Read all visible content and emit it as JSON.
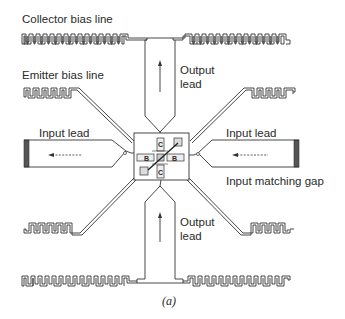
{
  "figure": {
    "labels": {
      "collector_bias_line": "Collector bias line",
      "emitter_bias_line": "Emitter bias line",
      "output_lead_top_1": "Output",
      "output_lead_top_2": "lead",
      "input_lead_left": "Input lead",
      "input_lead_right": "Input lead",
      "input_matching_gap": "Input  matching gap",
      "output_lead_bottom_1": "Output",
      "output_lead_bottom_2": "lead"
    },
    "chip": {
      "collector_top": "C",
      "collector_bottom": "C",
      "base_left": "B",
      "base_right": "B"
    },
    "caption": "(a)"
  }
}
